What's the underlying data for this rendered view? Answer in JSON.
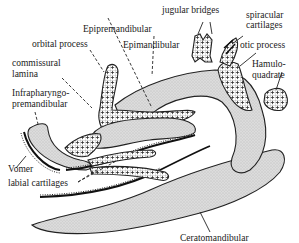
{
  "figure": {
    "colors": {
      "cartilage_stipple": "#d8d8d8",
      "crosshatch_fill": "#ffffff",
      "outline": "#222222",
      "background": "#ffffff"
    }
  },
  "labels": {
    "jugular_bridges": "jugular bridges",
    "spiracular_cartilages_1": "spiracular",
    "spiracular_cartilages_2": "cartilages",
    "epipremandibular": "Epipremandibular",
    "orbital_process": "orbital process",
    "epimandibular": "Epimandibular",
    "otic_process": "otic process",
    "commissural_lamina_1": "commissural",
    "commissural_lamina_2": "lamina",
    "hamuloquadrate_1": "Hamulo-",
    "hamuloquadrate_2": "quadrate",
    "infrapharyngo_1": "Infrapharyngo-",
    "infrapharyngo_2": "premandibular",
    "vomer": "Vomer",
    "labial_cartilages": "labial cartilages",
    "ceratomandibular": "Ceratomandibular"
  }
}
